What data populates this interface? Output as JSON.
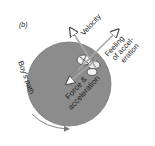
{
  "figure": {
    "panel_label": "(b)",
    "labels": {
      "velocity": "Velocity",
      "feeling_line1": "Feeling",
      "feeling_line2": "of accel-",
      "feeling_line3": "eration",
      "force_line1": "Force &",
      "force_line2": "acceleration",
      "path": "Boy's path"
    },
    "colors": {
      "disk": "#8c8c8c",
      "disk_edge": "#7a7a7a",
      "arrow": "#9a9a9a",
      "text": "#222222"
    }
  }
}
